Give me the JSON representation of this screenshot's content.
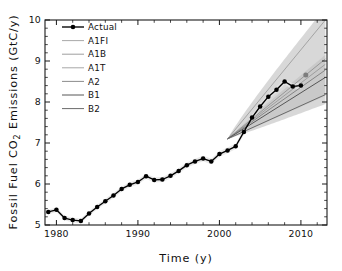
{
  "chart_data": {
    "type": "line",
    "title": "",
    "xlabel": "Time (y)",
    "ylabel": "Fossil Fuel CO2 Emissions (GtC/y)",
    "ylabel_parts": {
      "pre": "Fossil Fuel CO",
      "sub": "2",
      "post": " Emissions (GtC/y)"
    },
    "xlim": [
      1978.6,
      2013.2
    ],
    "ylim": [
      5,
      10
    ],
    "xticks": [
      1980,
      1990,
      2000,
      2010
    ],
    "xtick_labels": [
      "1980",
      "1990",
      "2000",
      "2010"
    ],
    "xtick_minor_step": 2,
    "yticks": [
      5,
      6,
      7,
      8,
      9,
      10
    ],
    "ytick_labels": [
      "5",
      "6",
      "7",
      "8",
      "9",
      "10"
    ],
    "ytick_minor_step": 0.2,
    "grid": false,
    "legend_position": "upper-left",
    "legend_entries": [
      {
        "label": "Actual",
        "color": "#000000",
        "width": 1.35,
        "marker": "filled-circle"
      },
      {
        "label": "A1FI",
        "color": "#9a9a9a",
        "width": 0.85,
        "marker": "none"
      },
      {
        "label": "A1B",
        "color": "#8e8e8e",
        "width": 0.85,
        "marker": "none"
      },
      {
        "label": "A1T",
        "color": "#969696",
        "width": 0.85,
        "marker": "none"
      },
      {
        "label": "A2",
        "color": "#7e7e7e",
        "width": 0.9,
        "marker": "none"
      },
      {
        "label": "B1",
        "color": "#565656",
        "width": 1.0,
        "marker": "none"
      },
      {
        "label": "B2",
        "color": "#6a6a6a",
        "width": 1.0,
        "marker": "none"
      }
    ],
    "series": [
      {
        "name": "Actual",
        "type": "line-markers",
        "color": "#000000",
        "x": [
          1979,
          1980,
          1981,
          1982,
          1983,
          1984,
          1985,
          1986,
          1987,
          1988,
          1989,
          1990,
          1991,
          1992,
          1993,
          1994,
          1995,
          1996,
          1997,
          1998,
          1999,
          2000,
          2001,
          2002,
          2003,
          2004,
          2005,
          2006,
          2007,
          2008,
          2009,
          2010
        ],
        "values": [
          5.32,
          5.37,
          5.17,
          5.12,
          5.1,
          5.28,
          5.44,
          5.58,
          5.72,
          5.88,
          5.98,
          6.05,
          6.19,
          6.1,
          6.11,
          6.2,
          6.32,
          6.46,
          6.55,
          6.62,
          6.55,
          6.73,
          6.82,
          6.92,
          7.27,
          7.62,
          7.89,
          8.13,
          8.3,
          8.5,
          8.38,
          8.4
        ]
      },
      {
        "name": "A1FI",
        "type": "projection",
        "color": "#9a9a9a",
        "x": [
          2001,
          2013
        ],
        "values": [
          7.1,
          10.0
        ]
      },
      {
        "name": "A1B",
        "type": "projection",
        "color": "#8e8e8e",
        "x": [
          2001,
          2013
        ],
        "values": [
          7.1,
          9.05
        ]
      },
      {
        "name": "A1T",
        "type": "projection",
        "color": "#969696",
        "x": [
          2001,
          2013
        ],
        "values": [
          7.1,
          8.92
        ]
      },
      {
        "name": "A2",
        "type": "projection",
        "color": "#7e7e7e",
        "x": [
          2001,
          2013
        ],
        "values": [
          7.1,
          8.78
        ]
      },
      {
        "name": "B1",
        "type": "projection",
        "color": "#565656",
        "x": [
          2001,
          2013
        ],
        "values": [
          7.1,
          8.6
        ]
      },
      {
        "name": "B2",
        "type": "projection",
        "color": "#6a6a6a",
        "x": [
          2001,
          2013
        ],
        "values": [
          7.1,
          8.18
        ]
      }
    ],
    "uncertainty_envelope": {
      "fill": "#c9c9c9",
      "x_start": 2001,
      "x_end": 2013,
      "start_value": 7.1,
      "upper_end": 10.3,
      "lower_end": 7.95
    },
    "observation_halo": {
      "fill": "#e4e4e4",
      "half_width": 0.12
    },
    "annotations": [
      {
        "name": "isolated-gray-point",
        "x": 2010.6,
        "y": 8.66,
        "marker": "filled-circle",
        "color": "#7d7d7d"
      }
    ]
  },
  "figure": {
    "frame_color": "#1a1a1a",
    "background": "#ffffff"
  }
}
